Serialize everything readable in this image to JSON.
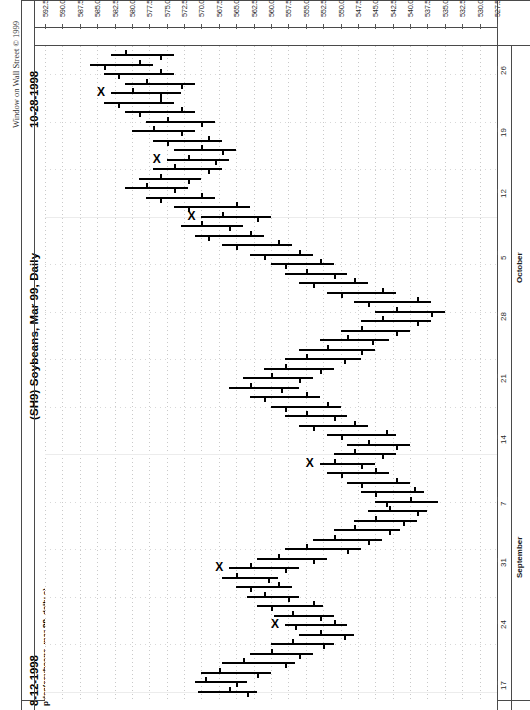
{
  "app": {
    "copyright": "Window on Wall Street © 1999",
    "end_date": "10-28-1998",
    "start_date": "8-12-1998",
    "title": "(SH9) Soybeans, Mar 99, Daily",
    "subtitle": "price(soybeans, mar 99, daily c)"
  },
  "chart_data": {
    "type": "bar",
    "chart_style": "ohlc-bar",
    "orientation": "rotated-90-ccw",
    "title": "(SH9) Soybeans, Mar 99, Daily",
    "subtitle": "price(soybeans, mar 99, daily c)",
    "xlabel": "",
    "ylabel": "price(soybeans, mar 99, daily c)",
    "ylim": [
      527.5,
      592.5
    ],
    "ytick_step": 2.5,
    "grid": true,
    "legend": "none",
    "date_range_start": "8-12-1998",
    "date_range_end": "10-28-1998",
    "price_ticks": [
      "592.50",
      "590.00",
      "587.50",
      "585.00",
      "582.50",
      "580.00",
      "577.50",
      "575.00",
      "572.50",
      "570.00",
      "567.50",
      "565.00",
      "562.50",
      "560.00",
      "557.50",
      "555.00",
      "552.50",
      "550.00",
      "547.50",
      "545.00",
      "542.50",
      "540.00",
      "537.50",
      "535.00",
      "532.50",
      "530.00",
      "527.50"
    ],
    "date_ticks": [
      "17",
      "24",
      "31",
      "7",
      "14",
      "21",
      "28",
      "5",
      "12",
      "19",
      "26"
    ],
    "month_labels": [
      "September",
      "October"
    ],
    "annotation_marker": "X",
    "annotation_count": 9,
    "bars": [
      {
        "i": 0,
        "high": 570.5,
        "low": 562.0,
        "open": 566.0,
        "close": 563.5,
        "mark": false
      },
      {
        "i": 1,
        "high": 571.0,
        "low": 563.5,
        "open": 569.5,
        "close": 565.0,
        "mark": false
      },
      {
        "i": 2,
        "high": 570.0,
        "low": 560.0,
        "open": 567.5,
        "close": 562.0,
        "mark": false
      },
      {
        "i": 3,
        "high": 567.0,
        "low": 556.5,
        "open": 564.0,
        "close": 558.0,
        "mark": false
      },
      {
        "i": 4,
        "high": 563.0,
        "low": 554.0,
        "open": 560.0,
        "close": 556.0,
        "mark": false
      },
      {
        "i": 5,
        "high": 560.0,
        "low": 551.0,
        "open": 557.0,
        "close": 552.5,
        "mark": false
      },
      {
        "i": 6,
        "high": 556.0,
        "low": 548.0,
        "open": 553.0,
        "close": 549.5,
        "mark": false
      },
      {
        "i": 7,
        "high": 558.0,
        "low": 549.0,
        "open": 551.0,
        "close": 556.5,
        "mark": true
      },
      {
        "i": 8,
        "high": 559.5,
        "low": 551.0,
        "open": 557.0,
        "close": 553.0,
        "mark": false
      },
      {
        "i": 9,
        "high": 562.0,
        "low": 552.5,
        "open": 554.0,
        "close": 560.0,
        "mark": false
      },
      {
        "i": 10,
        "high": 563.5,
        "low": 556.0,
        "open": 561.0,
        "close": 557.5,
        "mark": false
      },
      {
        "i": 11,
        "high": 565.0,
        "low": 557.0,
        "open": 559.0,
        "close": 563.0,
        "mark": false
      },
      {
        "i": 12,
        "high": 567.0,
        "low": 559.0,
        "open": 565.0,
        "close": 560.5,
        "mark": false
      },
      {
        "i": 13,
        "high": 566.0,
        "low": 556.0,
        "open": 563.0,
        "close": 558.0,
        "mark": true
      },
      {
        "i": 14,
        "high": 562.0,
        "low": 552.0,
        "open": 559.0,
        "close": 554.0,
        "mark": false
      },
      {
        "i": 15,
        "high": 558.0,
        "low": 547.0,
        "open": 555.0,
        "close": 549.0,
        "mark": false
      },
      {
        "i": 16,
        "high": 554.0,
        "low": 544.0,
        "open": 551.0,
        "close": 546.0,
        "mark": false
      },
      {
        "i": 17,
        "high": 551.0,
        "low": 541.5,
        "open": 548.0,
        "close": 543.0,
        "mark": false
      },
      {
        "i": 18,
        "high": 548.0,
        "low": 539.0,
        "open": 545.0,
        "close": 541.0,
        "mark": false
      },
      {
        "i": 19,
        "high": 546.0,
        "low": 537.5,
        "open": 543.0,
        "close": 539.0,
        "mark": false
      },
      {
        "i": 20,
        "high": 545.0,
        "low": 536.0,
        "open": 540.0,
        "close": 543.5,
        "mark": false
      },
      {
        "i": 21,
        "high": 547.0,
        "low": 538.0,
        "open": 539.5,
        "close": 545.0,
        "mark": false
      },
      {
        "i": 22,
        "high": 549.0,
        "low": 540.0,
        "open": 542.0,
        "close": 547.0,
        "mark": false
      },
      {
        "i": 23,
        "high": 552.0,
        "low": 543.0,
        "open": 545.0,
        "close": 550.0,
        "mark": false
      },
      {
        "i": 24,
        "high": 553.0,
        "low": 545.0,
        "open": 551.0,
        "close": 547.0,
        "mark": true
      },
      {
        "i": 25,
        "high": 551.0,
        "low": 542.0,
        "open": 548.0,
        "close": 544.0,
        "mark": false
      },
      {
        "i": 26,
        "high": 549.0,
        "low": 540.0,
        "open": 546.0,
        "close": 542.0,
        "mark": false
      },
      {
        "i": 27,
        "high": 552.0,
        "low": 542.0,
        "open": 543.5,
        "close": 550.0,
        "mark": false
      },
      {
        "i": 28,
        "high": 556.0,
        "low": 546.0,
        "open": 548.0,
        "close": 554.0,
        "mark": false
      },
      {
        "i": 29,
        "high": 558.0,
        "low": 549.0,
        "open": 555.0,
        "close": 551.0,
        "mark": false
      },
      {
        "i": 30,
        "high": 560.0,
        "low": 550.0,
        "open": 552.0,
        "close": 558.0,
        "mark": false
      },
      {
        "i": 31,
        "high": 563.0,
        "low": 553.0,
        "open": 555.0,
        "close": 561.0,
        "mark": false
      },
      {
        "i": 32,
        "high": 566.0,
        "low": 556.0,
        "open": 563.0,
        "close": 558.5,
        "mark": false
      },
      {
        "i": 33,
        "high": 564.0,
        "low": 554.0,
        "open": 560.0,
        "close": 556.0,
        "mark": false
      },
      {
        "i": 34,
        "high": 561.0,
        "low": 551.0,
        "open": 558.0,
        "close": 553.0,
        "mark": false
      },
      {
        "i": 35,
        "high": 558.0,
        "low": 547.0,
        "open": 555.0,
        "close": 549.5,
        "mark": false
      },
      {
        "i": 36,
        "high": 556.0,
        "low": 545.0,
        "open": 552.0,
        "close": 547.0,
        "mark": false
      },
      {
        "i": 37,
        "high": 553.0,
        "low": 543.0,
        "open": 549.0,
        "close": 545.5,
        "mark": false
      },
      {
        "i": 38,
        "high": 550.0,
        "low": 540.0,
        "open": 547.0,
        "close": 542.0,
        "mark": false
      },
      {
        "i": 39,
        "high": 547.0,
        "low": 537.0,
        "open": 544.0,
        "close": 539.0,
        "mark": false
      },
      {
        "i": 40,
        "high": 545.0,
        "low": 535.0,
        "open": 542.0,
        "close": 537.0,
        "mark": false
      },
      {
        "i": 41,
        "high": 548.0,
        "low": 537.0,
        "open": 539.0,
        "close": 546.0,
        "mark": false
      },
      {
        "i": 42,
        "high": 552.0,
        "low": 542.0,
        "open": 544.0,
        "close": 550.0,
        "mark": false
      },
      {
        "i": 43,
        "high": 556.0,
        "low": 546.0,
        "open": 548.0,
        "close": 554.0,
        "mark": false
      },
      {
        "i": 44,
        "high": 558.0,
        "low": 549.0,
        "open": 555.0,
        "close": 551.0,
        "mark": false
      },
      {
        "i": 45,
        "high": 560.0,
        "low": 551.0,
        "open": 553.0,
        "close": 558.0,
        "mark": false
      },
      {
        "i": 46,
        "high": 563.0,
        "low": 554.0,
        "open": 556.0,
        "close": 561.0,
        "mark": false
      },
      {
        "i": 47,
        "high": 567.0,
        "low": 557.0,
        "open": 559.0,
        "close": 565.0,
        "mark": false
      },
      {
        "i": 48,
        "high": 571.0,
        "low": 561.0,
        "open": 563.0,
        "close": 569.0,
        "mark": false
      },
      {
        "i": 49,
        "high": 573.0,
        "low": 564.0,
        "open": 570.0,
        "close": 566.0,
        "mark": false
      },
      {
        "i": 50,
        "high": 570.0,
        "low": 560.0,
        "open": 567.0,
        "close": 562.0,
        "mark": true
      },
      {
        "i": 51,
        "high": 574.0,
        "low": 563.0,
        "open": 565.0,
        "close": 572.0,
        "mark": false
      },
      {
        "i": 52,
        "high": 578.0,
        "low": 568.0,
        "open": 570.0,
        "close": 576.0,
        "mark": false
      },
      {
        "i": 53,
        "high": 581.0,
        "low": 572.0,
        "open": 578.0,
        "close": 574.0,
        "mark": false
      },
      {
        "i": 54,
        "high": 579.0,
        "low": 570.0,
        "open": 576.0,
        "close": 572.0,
        "mark": false
      },
      {
        "i": 55,
        "high": 577.0,
        "low": 567.0,
        "open": 574.0,
        "close": 569.0,
        "mark": false
      },
      {
        "i": 56,
        "high": 575.0,
        "low": 566.0,
        "open": 572.0,
        "close": 568.0,
        "mark": true
      },
      {
        "i": 57,
        "high": 574.0,
        "low": 565.0,
        "open": 570.0,
        "close": 567.0,
        "mark": false
      },
      {
        "i": 58,
        "high": 577.0,
        "low": 567.0,
        "open": 569.0,
        "close": 575.0,
        "mark": false
      },
      {
        "i": 59,
        "high": 580.0,
        "low": 571.0,
        "open": 577.0,
        "close": 573.0,
        "mark": false
      },
      {
        "i": 60,
        "high": 578.0,
        "low": 568.0,
        "open": 575.0,
        "close": 570.0,
        "mark": false
      },
      {
        "i": 61,
        "high": 581.0,
        "low": 571.0,
        "open": 573.0,
        "close": 579.0,
        "mark": false
      },
      {
        "i": 62,
        "high": 584.0,
        "low": 574.0,
        "open": 576.0,
        "close": 582.0,
        "mark": false
      },
      {
        "i": 63,
        "high": 583.0,
        "low": 573.0,
        "open": 580.0,
        "close": 576.0,
        "mark": true
      },
      {
        "i": 64,
        "high": 581.0,
        "low": 571.0,
        "open": 578.0,
        "close": 573.0,
        "mark": false
      },
      {
        "i": 65,
        "high": 584.0,
        "low": 574.0,
        "open": 576.0,
        "close": 582.0,
        "mark": false
      },
      {
        "i": 66,
        "high": 586.0,
        "low": 577.0,
        "open": 579.0,
        "close": 584.0,
        "mark": false
      },
      {
        "i": 67,
        "high": 583.0,
        "low": 574.0,
        "open": 581.0,
        "close": 576.0,
        "mark": false
      }
    ]
  }
}
